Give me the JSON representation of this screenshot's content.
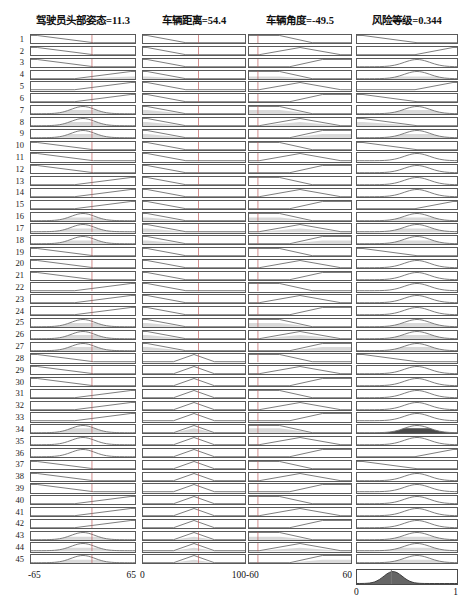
{
  "columns": [
    {
      "name": "input-driver-head-pose",
      "label": "驾驶员头部姿态=11.3",
      "varname": "驾驶员头部姿态",
      "value": "11.3",
      "axis_min": "-65",
      "axis_max": "65",
      "kind": "input",
      "indicator": 0.586
    },
    {
      "name": "input-vehicle-distance",
      "label": "车辆距离=54.4",
      "varname": "车辆距离",
      "value": "54.4",
      "axis_min": "0",
      "axis_max": "100",
      "kind": "input",
      "indicator": 0.544
    },
    {
      "name": "input-vehicle-angle",
      "label": "车辆角度=-49.5",
      "varname": "车辆角度",
      "value": "-49.5",
      "axis_min": "-60",
      "axis_max": "60",
      "kind": "input",
      "indicator": 0.0875
    },
    {
      "name": "output-risk-level",
      "label": "风险等级=0.344",
      "varname": "风险等级",
      "value": "0.344",
      "axis_min": "0",
      "axis_max": "1",
      "kind": "output",
      "indicator": 0.344
    }
  ],
  "rule_count": 45,
  "rule_numbers": [
    1,
    2,
    3,
    4,
    5,
    6,
    7,
    8,
    9,
    10,
    11,
    12,
    13,
    14,
    15,
    16,
    17,
    18,
    19,
    20,
    21,
    22,
    23,
    24,
    25,
    26,
    27,
    28,
    29,
    30,
    31,
    32,
    33,
    34,
    35,
    36,
    37,
    38,
    39,
    40,
    41,
    42,
    43,
    44,
    45
  ],
  "aggregate": {
    "name": "aggregate-output",
    "defuzz_value": "0.344",
    "axis_min": "0",
    "axis_max": "1"
  },
  "colors": {
    "cell_border": "#5a5a5a",
    "mf_line": "#6f6f6f",
    "fill": "#d9d9d9",
    "fill_dark": "#4a4a4a",
    "indicator": "#c06060",
    "text": "#111111",
    "background": "#ffffff"
  },
  "chart_data": {
    "type": "line",
    "xlabel": "",
    "ylabel": "",
    "grid": false,
    "legend": "none",
    "axes": [
      {
        "var": "驾驶员头部姿态",
        "range": [
          -65,
          65
        ],
        "current": 11.3
      },
      {
        "var": "车辆距离",
        "range": [
          0,
          100
        ],
        "current": 54.4
      },
      {
        "var": "车辆角度",
        "range": [
          -60,
          60
        ],
        "current": -49.5
      },
      {
        "var": "风险等级",
        "range": [
          0,
          1
        ],
        "current": 0.344
      }
    ],
    "rules": [
      {
        "n": 1,
        "a": "Z",
        "b": "Z",
        "c": "S",
        "d": "Z",
        "fire": 0.0
      },
      {
        "n": 2,
        "a": "Z",
        "b": "Z",
        "c": "M",
        "d": "B",
        "fire": 0.0
      },
      {
        "n": 3,
        "a": "Z",
        "b": "Z",
        "c": "B",
        "d": "M",
        "fire": 0.0
      },
      {
        "n": 4,
        "a": "B",
        "b": "Z",
        "c": "S",
        "d": "M",
        "fire": 0.3
      },
      {
        "n": 5,
        "a": "Z",
        "b": "Z",
        "c": "M",
        "d": "M",
        "fire": 0.0
      },
      {
        "n": 6,
        "a": "B",
        "b": "Z",
        "c": "B",
        "d": "B",
        "fire": 0.0
      },
      {
        "n": 7,
        "a": "M",
        "b": "Z",
        "c": "S",
        "d": "Z",
        "fire": 0.52
      },
      {
        "n": 8,
        "a": "M",
        "b": "Z",
        "c": "M",
        "d": "M",
        "fire": 0.52
      },
      {
        "n": 9,
        "a": "M",
        "b": "Z",
        "c": "B",
        "d": "M",
        "fire": 0.52
      },
      {
        "n": 10,
        "a": "Z",
        "b": "Z",
        "c": "S",
        "d": "Z",
        "fire": 0.0
      },
      {
        "n": 11,
        "a": "Z",
        "b": "M",
        "c": "M",
        "d": "M",
        "fire": 0.0
      },
      {
        "n": 12,
        "a": "Z",
        "b": "M",
        "c": "B",
        "d": "M",
        "fire": 0.0
      },
      {
        "n": 13,
        "a": "B",
        "b": "Z",
        "c": "S",
        "d": "M",
        "fire": 0.0
      },
      {
        "n": 14,
        "a": "M",
        "b": "Z",
        "c": "M",
        "d": "M",
        "fire": 0.0
      },
      {
        "n": 15,
        "a": "M",
        "b": "Z",
        "c": "B",
        "d": "B",
        "fire": 0.0
      },
      {
        "n": 16,
        "a": "M",
        "b": "Z",
        "c": "S",
        "d": "M",
        "fire": 0.46
      },
      {
        "n": 17,
        "a": "M",
        "b": "Z",
        "c": "M",
        "d": "M",
        "fire": 0.46
      },
      {
        "n": 18,
        "a": "M",
        "b": "Z",
        "c": "B",
        "d": "M",
        "fire": 0.46
      },
      {
        "n": 19,
        "a": "Z",
        "b": "Z",
        "c": "S",
        "d": "S",
        "fire": 0.0
      },
      {
        "n": 20,
        "a": "Z",
        "b": "Z",
        "c": "M",
        "d": "M",
        "fire": 0.0
      },
      {
        "n": 21,
        "a": "Z",
        "b": "Z",
        "c": "B",
        "d": "M",
        "fire": 0.0
      },
      {
        "n": 22,
        "a": "B",
        "b": "Z",
        "c": "S",
        "d": "M",
        "fire": 0.0
      },
      {
        "n": 23,
        "a": "Z",
        "b": "Z",
        "c": "M",
        "d": "M",
        "fire": 0.0
      },
      {
        "n": 24,
        "a": "Z",
        "b": "Z",
        "c": "B",
        "d": "M",
        "fire": 0.0
      },
      {
        "n": 25,
        "a": "M",
        "b": "Z",
        "c": "S",
        "d": "M",
        "fire": 0.5
      },
      {
        "n": 26,
        "a": "M",
        "b": "Z",
        "c": "M",
        "d": "M",
        "fire": 0.5
      },
      {
        "n": 27,
        "a": "M",
        "b": "Z",
        "c": "B",
        "d": "M",
        "fire": 0.5
      },
      {
        "n": 28,
        "a": "Z",
        "b": "M",
        "c": "S",
        "d": "S",
        "fire": 0.0
      },
      {
        "n": 29,
        "a": "Z",
        "b": "M",
        "c": "M",
        "d": "M",
        "fire": 0.0
      },
      {
        "n": 30,
        "a": "Z",
        "b": "M",
        "c": "B",
        "d": "M",
        "fire": 0.0
      },
      {
        "n": 31,
        "a": "B",
        "b": "M",
        "c": "S",
        "d": "M",
        "fire": 0.0
      },
      {
        "n": 32,
        "a": "Z",
        "b": "M",
        "c": "M",
        "d": "M",
        "fire": 0.0
      },
      {
        "n": 33,
        "a": "Z",
        "b": "M",
        "c": "B",
        "d": "M",
        "fire": 0.0
      },
      {
        "n": 34,
        "a": "M",
        "b": "M",
        "c": "S",
        "d": "M",
        "fire": 0.62
      },
      {
        "n": 35,
        "a": "M",
        "b": "M",
        "c": "M",
        "d": "M",
        "fire": 0.0
      },
      {
        "n": 36,
        "a": "M",
        "b": "M",
        "c": "B",
        "d": "B",
        "fire": 0.0
      },
      {
        "n": 37,
        "a": "Z",
        "b": "M",
        "c": "S",
        "d": "S",
        "fire": 0.0
      },
      {
        "n": 38,
        "a": "Z",
        "b": "M",
        "c": "M",
        "d": "M",
        "fire": 0.0
      },
      {
        "n": 39,
        "a": "Z",
        "b": "M",
        "c": "B",
        "d": "M",
        "fire": 0.0
      },
      {
        "n": 40,
        "a": "B",
        "b": "M",
        "c": "S",
        "d": "M",
        "fire": 0.0
      },
      {
        "n": 41,
        "a": "Z",
        "b": "M",
        "c": "M",
        "d": "M",
        "fire": 0.0
      },
      {
        "n": 42,
        "a": "Z",
        "b": "M",
        "c": "B",
        "d": "M",
        "fire": 0.0
      },
      {
        "n": 43,
        "a": "M",
        "b": "M",
        "c": "S",
        "d": "M",
        "fire": 0.42
      },
      {
        "n": 44,
        "a": "M",
        "b": "M",
        "c": "M",
        "d": "M",
        "fire": 0.42
      },
      {
        "n": 45,
        "a": "M",
        "b": "M",
        "c": "B",
        "d": "M",
        "fire": 0.42
      }
    ]
  }
}
